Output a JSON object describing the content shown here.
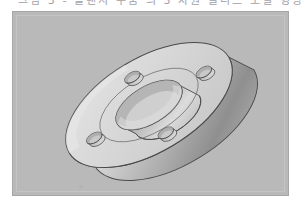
{
  "document": {
    "caption_line": "그림 3 ‑ 플랜지 부품 의 3 차원 솔리드 모델 형상",
    "caption_visible": "partially cropped at top edge"
  },
  "figure": {
    "name": "flange-3d-model",
    "projection": "isometric",
    "background_color": "#b9b9b9",
    "border_color": "#a6a6a6",
    "inner_border_color": "#c4c4c4",
    "panel": {
      "x": 12,
      "y": 11,
      "width": 277,
      "height": 185
    },
    "object": {
      "type": "flange",
      "outer_diameter_px": 186,
      "center_bore_diameter_px": 74,
      "bolt_hole_count": 4,
      "bolt_hole_diameter_px": 17,
      "bolt_circle_diameter_px": 128,
      "thickness_px": 34,
      "center": {
        "x": 148,
        "y": 100
      }
    },
    "shading": {
      "top_face": "#d4d4d4",
      "top_face_highlight": "#e3e3e3",
      "rim_light": "#d9d9d9",
      "rim_mid": "#b4b4b4",
      "rim_dark": "#8e8e8e",
      "bore_wall_light": "#dcdcdc",
      "bore_wall_dark": "#9a9a9a",
      "hole_wall": "#b0b0b0",
      "outline": "#4a4a4a"
    },
    "artifacts": {
      "scan_speck_label": "scan-speck"
    }
  }
}
